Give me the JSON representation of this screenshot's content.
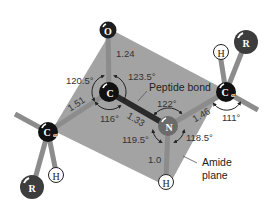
{
  "diagram": {
    "colors": {
      "plane": "#a3a3a3",
      "bond": "#8c8c8c",
      "peptide_bond": "#2a2a2a",
      "carbon_atom": "#111111",
      "oxygen_atom": "#1e1e1e",
      "nitrogen_atom": "#6b6b6b",
      "r_group": "#3d3d3d",
      "hydrogen_fill": "#ffffff"
    },
    "atoms": {
      "oxygen": {
        "label": "O"
      },
      "carbonyl_carbon": {
        "label": "C"
      },
      "nitrogen": {
        "label": "N"
      },
      "alpha_carbon_left": {
        "label": "C",
        "subscript": "α"
      },
      "alpha_carbon_right": {
        "label": "C",
        "subscript": "α"
      },
      "hydrogen_amide": {
        "label": "H"
      },
      "hydrogen_left": {
        "label": "H"
      },
      "hydrogen_right": {
        "label": "H"
      },
      "r_left": {
        "label": "R"
      },
      "r_right": {
        "label": "R"
      }
    },
    "bond_lengths": {
      "c_o": "1.24",
      "c_calpha": "1.51",
      "c_n": "1.33",
      "n_calpha": "1.46",
      "n_h": "1.0"
    },
    "bond_angles": {
      "calpha_c_o": "120.5°",
      "o_c_n": "123.5°",
      "calpha_c_n": "116°",
      "c_n_calpha": "122°",
      "c_n_h": "119.5°",
      "calpha_n_h": "118.5°",
      "right_calpha": "111°"
    },
    "annotations": {
      "peptide_bond": "Peptide bond",
      "amide_plane_line1": "Amide",
      "amide_plane_line2": "plane"
    }
  }
}
